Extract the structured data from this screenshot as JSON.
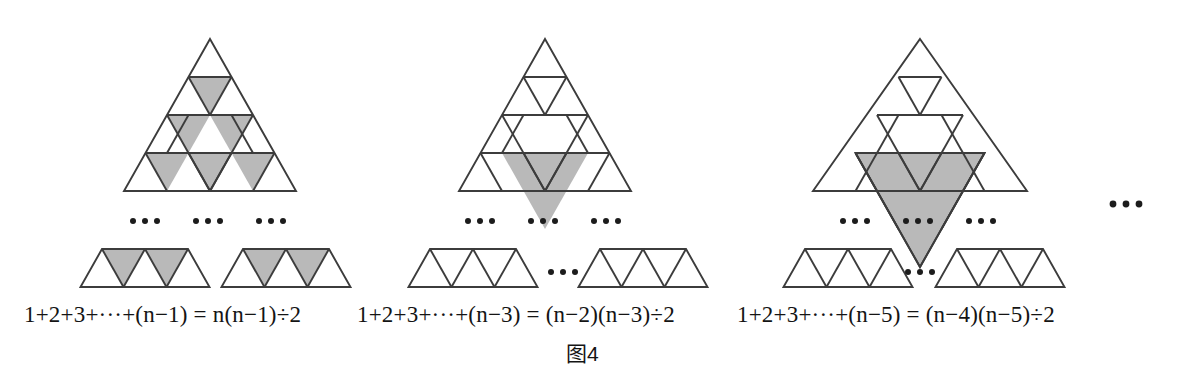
{
  "figure": {
    "caption_label": "图",
    "caption_number": "4",
    "caption_full": "图4",
    "background_color": "#ffffff",
    "stroke_color": "#3c3c3c",
    "shade_color": "#b9b9b9",
    "text_color": "#141414",
    "ellipsis_glyph": "•••"
  },
  "panels": [
    {
      "id": "panel-1",
      "index": 1,
      "big_triangle": {
        "rows": 4,
        "shaded_cells": "all-downward",
        "shaded_count": 6
      },
      "strips": [
        {
          "id": "strip-1a",
          "up_triangles": 3,
          "down_triangles": 2,
          "down_shaded": true
        },
        {
          "id": "strip-1b",
          "up_triangles": 3,
          "down_triangles": 2,
          "down_shaded": true
        }
      ],
      "ellipsis_count": 3,
      "formula": "1+2+3+···+(n−1) = n(n−1)÷2",
      "formula_parts": {
        "lhs": "1+2+3+···+(n−1)",
        "equals": "=",
        "rhs": "n(n−1)÷2"
      }
    },
    {
      "id": "panel-2",
      "index": 2,
      "big_triangle": {
        "rows": 4,
        "shaded_cells": "center-inverted-side-2",
        "shaded_count": 4
      },
      "strips": [
        {
          "id": "strip-2a",
          "up_triangles": 3,
          "down_triangles": 2,
          "down_shaded": false
        },
        {
          "id": "strip-2b",
          "up_triangles": 3,
          "down_triangles": 2,
          "down_shaded": false
        }
      ],
      "ellipsis_count": 4,
      "formula": "1+2+3+···+(n−3) = (n−2)(n−3)÷2",
      "formula_parts": {
        "lhs": "1+2+3+···+(n−3)",
        "equals": "=",
        "rhs": "(n−2)(n−3)÷2"
      }
    },
    {
      "id": "panel-3",
      "index": 3,
      "big_triangle": {
        "rows": 5,
        "shaded_cells": "center-inverted-side-3",
        "shaded_count": 9
      },
      "strips": [
        {
          "id": "strip-3a",
          "up_triangles": 3,
          "down_triangles": 2,
          "down_shaded": false
        },
        {
          "id": "strip-3b",
          "up_triangles": 3,
          "down_triangles": 2,
          "down_shaded": false
        }
      ],
      "ellipsis_count": 4,
      "formula": "1+2+3+···+(n−5) = (n−4)(n−5)÷2",
      "formula_parts": {
        "lhs": "1+2+3+···+(n−5)",
        "equals": "=",
        "rhs": "(n−4)(n−5)÷2"
      }
    }
  ],
  "trailing_ellipsis": "•••",
  "formula_text": {
    "f1": "1+2+3+···+(",
    "f1_v": "n",
    "f1_b": "−1 ) = ",
    "f1_v2": "n",
    "f1_c": " (",
    "f1_v3": "n",
    "f1_d": "−1 )÷2"
  }
}
